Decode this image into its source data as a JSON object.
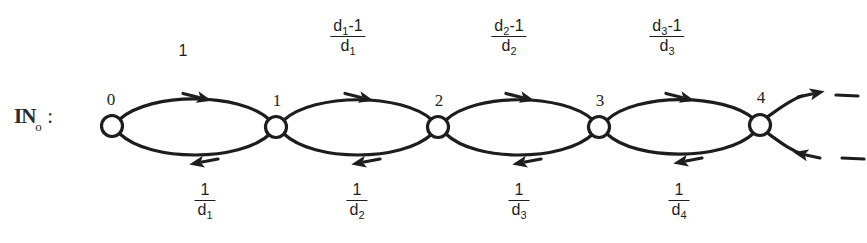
{
  "figure": {
    "set_label": {
      "symbol": "IN",
      "subscript": "o",
      "colon": ":"
    },
    "nodes": [
      {
        "label": "0",
        "cx": 112,
        "cy": 126
      },
      {
        "label": "1",
        "cx": 276,
        "cy": 127
      },
      {
        "label": "2",
        "cx": 438,
        "cy": 127
      },
      {
        "label": "3",
        "cx": 599,
        "cy": 127
      },
      {
        "label": "4",
        "cx": 760,
        "cy": 125
      }
    ],
    "top_edge_labels": [
      {
        "kind": "plain",
        "text": "1",
        "x": 183,
        "y": 40
      },
      {
        "kind": "fraction",
        "numerator": "d1 - 1",
        "denominator": "d1",
        "num_base": "d",
        "num_sub": "1",
        "num_tail": "-1",
        "den_base": "d",
        "den_sub": "1",
        "x": 348,
        "y": 18
      },
      {
        "kind": "fraction",
        "numerator": "d2 - 1",
        "denominator": "d2",
        "num_base": "d",
        "num_sub": "2",
        "num_tail": "-1",
        "den_base": "d",
        "den_sub": "2",
        "x": 509,
        "y": 18
      },
      {
        "kind": "fraction",
        "numerator": "d3 - 1",
        "denominator": "d3",
        "num_base": "d",
        "num_sub": "3",
        "num_tail": "-1",
        "den_base": "d",
        "den_sub": "3",
        "x": 667,
        "y": 18
      }
    ],
    "bottom_edge_labels": [
      {
        "kind": "fraction",
        "numerator": "1",
        "denominator": "d1",
        "den_base": "d",
        "den_sub": "1",
        "x": 205,
        "y": 182
      },
      {
        "kind": "fraction",
        "numerator": "1",
        "denominator": "d2",
        "den_base": "d",
        "den_sub": "2",
        "x": 357,
        "y": 182
      },
      {
        "kind": "fraction",
        "numerator": "1",
        "denominator": "d3",
        "den_base": "d",
        "den_sub": "3",
        "x": 519,
        "y": 182
      },
      {
        "kind": "fraction",
        "numerator": "1",
        "denominator": "d4",
        "den_base": "d",
        "den_sub": "4",
        "x": 679,
        "y": 182
      }
    ],
    "colors": {
      "ink": "#1d1d1d",
      "background": "#ffffff"
    }
  }
}
